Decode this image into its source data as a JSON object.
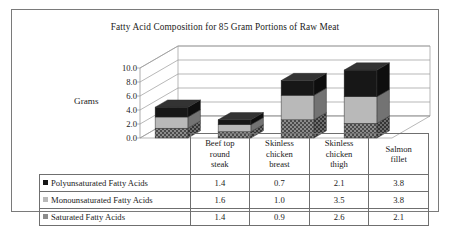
{
  "chart_data": {
    "type": "bar",
    "subtype": "stacked-column-3d",
    "title": "Fatty Acid Composition for 85 Gram Portions of Raw Meat",
    "xlabel": "",
    "ylabel": "Grams",
    "ylim": [
      0.0,
      10.0
    ],
    "ytick_labels": [
      "10.0",
      "8.0",
      "6.0",
      "4.0",
      "2.0",
      "0.0"
    ],
    "ytick_values": [
      10.0,
      8.0,
      6.0,
      4.0,
      2.0,
      0.0
    ],
    "grid": true,
    "legend_position": "bottom-table",
    "categories": [
      "Beef top round steak",
      "Skinless chicken breast",
      "Skinless chicken thigh",
      "Salmon fillet"
    ],
    "category_lines": [
      [
        "Beef top",
        "round",
        "steak"
      ],
      [
        "Skinless",
        "chicken",
        "breast"
      ],
      [
        "Skinless",
        "chicken",
        "thigh"
      ],
      [
        "Salmon",
        "fillet"
      ]
    ],
    "series": [
      {
        "name": "Polyunsaturated Fatty Acids",
        "color": "#171717",
        "fill": "solid-black",
        "values": [
          1.4,
          0.7,
          2.1,
          3.8
        ],
        "labels": [
          "1.4",
          "0.7",
          "2.1",
          "3.8"
        ]
      },
      {
        "name": "Monounsaturated Fatty Acids",
        "color": "#b9b9b9",
        "fill": "light-gray",
        "values": [
          1.6,
          1.0,
          3.5,
          3.8
        ],
        "labels": [
          "1.6",
          "1.0",
          "3.5",
          "3.8"
        ]
      },
      {
        "name": "Saturated Fatty Acids",
        "color": "#8c8c8c",
        "fill": "dark-hatch",
        "values": [
          1.4,
          0.9,
          2.6,
          2.1
        ],
        "labels": [
          "1.4",
          "0.9",
          "2.6",
          "2.1"
        ]
      }
    ],
    "stack_order_bottom_to_top": [
      "Saturated Fatty Acids",
      "Monounsaturated Fatty Acids",
      "Polyunsaturated Fatty Acids"
    ],
    "totals": [
      4.4,
      2.6,
      8.2,
      9.7
    ]
  },
  "colors": {
    "frame": "#7a7a7a",
    "gridline": "#9a9a9a",
    "table_border": "#6f6f6f",
    "text": "#1a1a1a",
    "poly": "#171717",
    "mono": "#b9b9b9",
    "sat": "#8c8c8c"
  }
}
